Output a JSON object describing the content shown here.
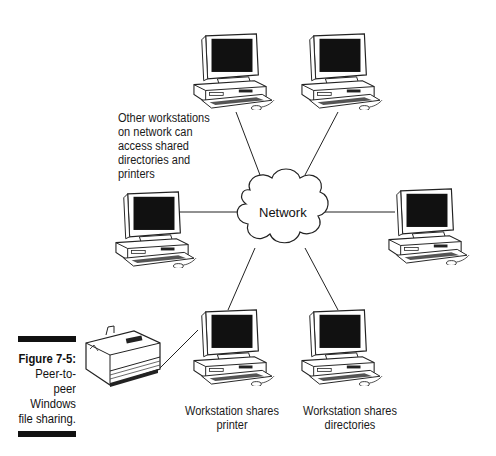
{
  "figure": {
    "number_label": "Figure 7-5:",
    "caption_lines": [
      "Peer-to-",
      "peer",
      "Windows",
      "file sharing."
    ]
  },
  "network": {
    "label": "Network"
  },
  "annotations": {
    "other_workstations": [
      "Other workstations",
      "on network can",
      "access shared",
      "directories and",
      "printers"
    ],
    "printer_workstation": [
      "Workstation shares",
      "printer"
    ],
    "directory_workstation": [
      "Workstation shares",
      "directories"
    ]
  },
  "nodes": [
    {
      "id": "ws-top-left",
      "type": "workstation"
    },
    {
      "id": "ws-top-right",
      "type": "workstation"
    },
    {
      "id": "ws-mid-left",
      "type": "workstation"
    },
    {
      "id": "ws-mid-right",
      "type": "workstation"
    },
    {
      "id": "ws-bottom-left",
      "type": "workstation",
      "role": "shares printer"
    },
    {
      "id": "ws-bottom-right",
      "type": "workstation",
      "role": "shares directories"
    },
    {
      "id": "printer",
      "type": "printer"
    }
  ],
  "colors": {
    "line": "#222222",
    "screen": "#111111",
    "body": "#ffffff"
  }
}
